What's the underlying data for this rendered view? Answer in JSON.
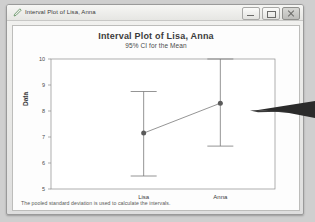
{
  "window": {
    "title": "Interval Plot of Lisa, Anna",
    "icon": "pencil-icon",
    "controls": [
      {
        "name": "minimize",
        "label": "Minimize"
      },
      {
        "name": "maximize",
        "label": "Maximize"
      },
      {
        "name": "close",
        "label": "Close"
      }
    ]
  },
  "footnote": "The pooled standard deviation is used to calculate the intervals.",
  "colors": {
    "frame": "#9a9a9a",
    "panel": "#fdfdfd",
    "axis": "#8c8c8c",
    "marker": "#5a5a5a",
    "line": "#7a7a7a",
    "arrow": "#2b2b2b"
  },
  "chart_data": {
    "type": "line",
    "title": "Interval Plot of Lisa, Anna",
    "subtitle": "95% CI for the Mean",
    "xlabel": "",
    "ylabel": "Data",
    "categories": [
      "Lisa",
      "Anna"
    ],
    "values": [
      7.15,
      8.3
    ],
    "error_low": [
      5.5,
      6.65
    ],
    "error_high": [
      8.75,
      10.0
    ],
    "ylim": [
      5,
      10
    ],
    "yticks": [
      10,
      9,
      8,
      7,
      6,
      5
    ],
    "grid": false,
    "legend": null,
    "series": [
      {
        "name": "95% CI for the Mean",
        "points": [
          {
            "category": "Lisa",
            "mean": 7.15,
            "lower": 5.5,
            "upper": 8.75
          },
          {
            "category": "Anna",
            "mean": 8.3,
            "lower": 6.65,
            "upper": 10.0
          }
        ]
      }
    ]
  }
}
